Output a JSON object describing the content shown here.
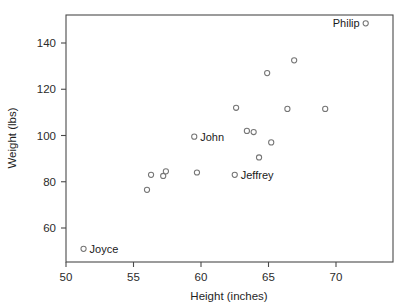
{
  "chart_data": {
    "type": "scatter",
    "title": "",
    "xlabel": "Height (inches)",
    "ylabel": "Weight (lbs)",
    "xlim": [
      49.0,
      73.2
    ],
    "ylim": [
      47.0,
      150.5
    ],
    "xticks": [
      50,
      55,
      60,
      65,
      70
    ],
    "yticks": [
      60,
      80,
      100,
      120,
      140
    ],
    "xtick_labels": [
      "50",
      "55",
      "60",
      "65",
      "70"
    ],
    "ytick_labels": [
      "60",
      "80",
      "100",
      "120",
      "140"
    ],
    "grid": false,
    "legend": "none",
    "marker": "open-circle",
    "points": [
      {
        "x": 51.3,
        "y": 51.0,
        "label": "Joyce",
        "label_pos": "right"
      },
      {
        "x": 56.0,
        "y": 76.5,
        "label": "",
        "label_pos": ""
      },
      {
        "x": 56.3,
        "y": 83.0,
        "label": "",
        "label_pos": ""
      },
      {
        "x": 57.2,
        "y": 82.5,
        "label": "",
        "label_pos": ""
      },
      {
        "x": 57.4,
        "y": 84.5,
        "label": "",
        "label_pos": ""
      },
      {
        "x": 59.5,
        "y": 99.5,
        "label": "John",
        "label_pos": "right"
      },
      {
        "x": 59.7,
        "y": 84.0,
        "label": "",
        "label_pos": ""
      },
      {
        "x": 62.5,
        "y": 83.0,
        "label": "Jeffrey",
        "label_pos": "right"
      },
      {
        "x": 62.6,
        "y": 112.0,
        "label": "",
        "label_pos": ""
      },
      {
        "x": 63.4,
        "y": 102.0,
        "label": "",
        "label_pos": ""
      },
      {
        "x": 63.9,
        "y": 101.5,
        "label": "",
        "label_pos": ""
      },
      {
        "x": 64.3,
        "y": 90.5,
        "label": "",
        "label_pos": ""
      },
      {
        "x": 64.9,
        "y": 127.0,
        "label": "",
        "label_pos": ""
      },
      {
        "x": 65.2,
        "y": 97.0,
        "label": "",
        "label_pos": ""
      },
      {
        "x": 66.4,
        "y": 111.5,
        "label": "",
        "label_pos": ""
      },
      {
        "x": 66.9,
        "y": 132.5,
        "label": "",
        "label_pos": ""
      },
      {
        "x": 69.2,
        "y": 111.5,
        "label": "",
        "label_pos": ""
      },
      {
        "x": 72.2,
        "y": 148.5,
        "label": "Philip",
        "label_pos": "left"
      }
    ]
  },
  "colors": {
    "frame": "#4a4a4a",
    "marker_stroke": "#757575",
    "marker_fill": "#ffffff",
    "text": "#1a1a1a",
    "background": "#ffffff"
  }
}
